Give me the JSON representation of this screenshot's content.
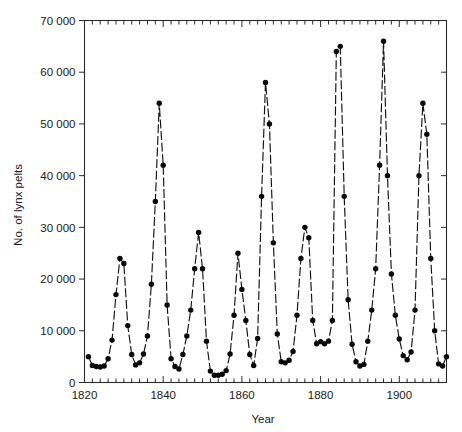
{
  "chart_data": {
    "type": "line",
    "title": "",
    "xlabel": "Year",
    "ylabel": "No. of lynx pelts",
    "xlim": [
      1820,
      1912
    ],
    "ylim": [
      0,
      70000
    ],
    "grid": false,
    "legend": null,
    "marker": "filled-circle",
    "line_style": "dashed",
    "x_tick_labels": [
      "1820",
      "1840",
      "1860",
      "1880",
      "1900"
    ],
    "x_major_ticks": [
      1820,
      1840,
      1860,
      1880,
      1900
    ],
    "x_minor_tick_step": 2,
    "y_tick_labels": [
      "0",
      "10 000",
      "20 000",
      "30 000",
      "40 000",
      "50 000",
      "60 000",
      "70 000"
    ],
    "y_major_ticks": [
      0,
      10000,
      20000,
      30000,
      40000,
      50000,
      60000,
      70000
    ],
    "x": [
      1821,
      1822,
      1823,
      1824,
      1825,
      1826,
      1827,
      1828,
      1829,
      1830,
      1831,
      1832,
      1833,
      1834,
      1835,
      1836,
      1837,
      1838,
      1839,
      1840,
      1841,
      1842,
      1843,
      1844,
      1845,
      1846,
      1847,
      1848,
      1849,
      1850,
      1851,
      1852,
      1853,
      1854,
      1855,
      1856,
      1857,
      1858,
      1859,
      1860,
      1861,
      1862,
      1863,
      1864,
      1865,
      1866,
      1867,
      1868,
      1869,
      1870,
      1871,
      1872,
      1873,
      1874,
      1875,
      1876,
      1877,
      1878,
      1879,
      1880,
      1881,
      1882,
      1883,
      1884,
      1885,
      1886,
      1887,
      1888,
      1889,
      1890,
      1891,
      1892,
      1893,
      1894,
      1895,
      1896,
      1897,
      1898,
      1899,
      1900,
      1901,
      1902,
      1903,
      1904,
      1905,
      1906,
      1907,
      1908,
      1909,
      1910,
      1911,
      1912
    ],
    "values": [
      5000,
      3300,
      3100,
      3000,
      3200,
      4600,
      8200,
      17000,
      24000,
      23000,
      11000,
      5400,
      3400,
      3800,
      5500,
      9000,
      19000,
      35000,
      54000,
      42000,
      15000,
      4600,
      3100,
      2600,
      5400,
      9000,
      14000,
      22000,
      29000,
      22000,
      8000,
      2200,
      1400,
      1400,
      1600,
      2300,
      5500,
      13000,
      25000,
      18000,
      12000,
      5400,
      3300,
      8500,
      36000,
      58000,
      50000,
      27000,
      9400,
      4000,
      3800,
      4300,
      6000,
      13000,
      24000,
      30000,
      28000,
      12000,
      7500,
      7900,
      7500,
      8000,
      12000,
      64000,
      65000,
      36000,
      16000,
      7400,
      4000,
      3200,
      3500,
      8000,
      14000,
      22000,
      42000,
      66000,
      40000,
      21000,
      13000,
      8400,
      5200,
      4400,
      5900,
      14000,
      40000,
      54000,
      48000,
      24000,
      10000,
      3600,
      3200,
      5000
    ]
  },
  "axis": {
    "y_label": "No. of lynx pelts",
    "x_label": "Year"
  }
}
